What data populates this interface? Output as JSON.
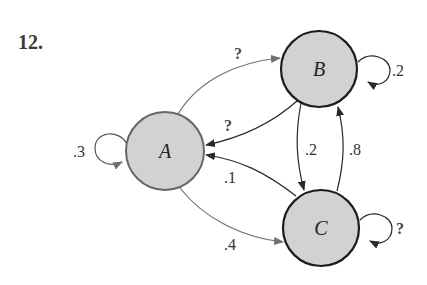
{
  "problem_number": "12.",
  "colors": {
    "node_fill": "#d2d2d2",
    "node_stroke_dark": "#1c1c1c",
    "node_stroke_light": "#666666",
    "edge_gray": "#707070",
    "edge_dark": "#2a2a2a"
  },
  "nodes": [
    {
      "id": "A",
      "label": "A"
    },
    {
      "id": "B",
      "label": "B"
    },
    {
      "id": "C",
      "label": "C"
    }
  ],
  "edges": [
    {
      "from": "A",
      "to": "A",
      "label": ".3"
    },
    {
      "from": "A",
      "to": "B",
      "label": "?"
    },
    {
      "from": "B",
      "to": "A",
      "label": "?"
    },
    {
      "from": "B",
      "to": "B",
      "label": ".2"
    },
    {
      "from": "B",
      "to": "C",
      "label": ".2"
    },
    {
      "from": "C",
      "to": "B",
      "label": ".8"
    },
    {
      "from": "C",
      "to": "A",
      "label": ".1"
    },
    {
      "from": "A",
      "to": "C",
      "label": ".4"
    },
    {
      "from": "C",
      "to": "C",
      "label": "?"
    }
  ]
}
